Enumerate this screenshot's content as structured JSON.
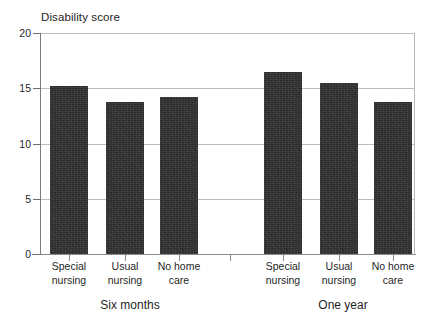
{
  "chart_data": {
    "type": "bar",
    "title": "Disability score",
    "xlabel": "",
    "ylabel": "Disability score",
    "ylim": [
      0,
      20
    ],
    "yticks": [
      0,
      5,
      10,
      15,
      20
    ],
    "grid": true,
    "legend": "none",
    "groups": [
      {
        "name": "Six months",
        "categories": [
          "Special nursing",
          "Usual nursing",
          "No home care"
        ],
        "values": [
          15.2,
          13.8,
          14.2
        ]
      },
      {
        "name": "One year",
        "categories": [
          "Special nursing",
          "Usual nursing",
          "No home care"
        ],
        "values": [
          16.5,
          15.5,
          13.8
        ]
      }
    ],
    "categories": [
      "Special nursing",
      "Usual nursing",
      "No home care",
      "Special nursing",
      "Usual nursing",
      "No home care"
    ],
    "values": [
      15.2,
      13.8,
      14.2,
      16.5,
      15.5,
      13.8
    ],
    "bar_color": "#2b2b2b"
  },
  "axis": {
    "y_tick_labels": [
      "20",
      "15",
      "10",
      "5",
      "0"
    ]
  },
  "categories": [
    {
      "line1": "Special",
      "line2": "nursing"
    },
    {
      "line1": "Usual",
      "line2": "nursing"
    },
    {
      "line1": "No home",
      "line2": "care"
    },
    {
      "line1": "Special",
      "line2": "nursing"
    },
    {
      "line1": "Usual",
      "line2": "nursing"
    },
    {
      "line1": "No home",
      "line2": "care"
    }
  ],
  "groups": [
    {
      "label": "Six months"
    },
    {
      "label": "One year"
    }
  ]
}
